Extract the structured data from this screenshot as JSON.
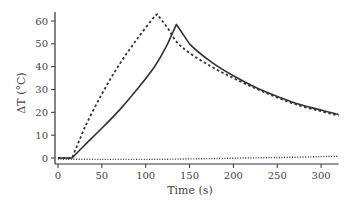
{
  "chart_data": {
    "type": "line",
    "title": "",
    "xlabel": "Time (s)",
    "ylabel": "ΔT (°C)",
    "xlim": [
      0,
      320
    ],
    "ylim": [
      -2,
      65
    ],
    "xticks": [
      0,
      50,
      100,
      150,
      200,
      250,
      300
    ],
    "yticks": [
      0,
      10,
      20,
      30,
      40,
      50,
      60
    ],
    "grid": false,
    "legend": "none",
    "series": [
      {
        "name": "solid",
        "style": "solid",
        "x": [
          0,
          16,
          30,
          50,
          70,
          90,
          110,
          125,
          135,
          150,
          175,
          200,
          225,
          250,
          275,
          300,
          320
        ],
        "y": [
          0,
          0,
          5.5,
          13,
          21,
          30,
          40,
          50,
          58.5,
          50,
          42,
          36,
          31,
          27,
          23.5,
          21,
          19
        ]
      },
      {
        "name": "dashed",
        "style": "dashed",
        "x": [
          0,
          16,
          30,
          50,
          70,
          90,
          110,
          113,
          125,
          135,
          150,
          175,
          200,
          225,
          250,
          275,
          300,
          320
        ],
        "y": [
          0,
          0,
          13,
          28,
          41,
          52,
          62,
          63,
          57,
          51,
          46,
          40,
          35,
          30.5,
          26.5,
          23,
          20.5,
          18.5
        ]
      },
      {
        "name": "dotted",
        "style": "dotted",
        "x": [
          0,
          50,
          100,
          150,
          200,
          250,
          300,
          320
        ],
        "y": [
          -0.5,
          -0.6,
          -0.6,
          -0.4,
          -0.1,
          0.2,
          0.6,
          0.8
        ]
      }
    ]
  }
}
